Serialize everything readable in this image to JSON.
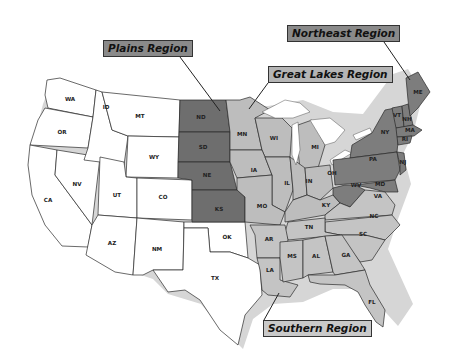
{
  "map": {
    "regions": [
      {
        "id": "plains",
        "label": "Plains Region",
        "color": "#6e6e6e",
        "states": [
          "ND",
          "SD",
          "NE",
          "KS"
        ]
      },
      {
        "id": "great_lakes",
        "label": "Great Lakes Region",
        "color": "#bdbdbd",
        "states": [
          "MN",
          "WI",
          "MI",
          "IA",
          "IL",
          "IN",
          "OH",
          "MO",
          "KY"
        ]
      },
      {
        "id": "northeast",
        "label": "Northeast Region",
        "color": "#7d7d7d",
        "states": [
          "ME",
          "VT",
          "NH",
          "MA",
          "RI",
          "CT",
          "NY",
          "NJ",
          "PA",
          "DE",
          "MD",
          "WV"
        ]
      },
      {
        "id": "southern",
        "label": "Southern Region",
        "color": "#c4c4c4",
        "states": [
          "VA",
          "NC",
          "SC",
          "TN",
          "AR",
          "LA",
          "MS",
          "AL",
          "GA",
          "FL"
        ]
      },
      {
        "id": "west",
        "label": "",
        "color": "#ffffff",
        "states": [
          "WA",
          "OR",
          "CA",
          "ID",
          "NV",
          "MT",
          "WY",
          "UT",
          "CO",
          "AZ",
          "NM",
          "OK",
          "TX"
        ]
      }
    ],
    "state_labels": {
      "WA": "WA",
      "OR": "OR",
      "CA": "CA",
      "ID": "ID",
      "NV": "NV",
      "MT": "MT",
      "WY": "WY",
      "UT": "UT",
      "CO": "CO",
      "AZ": "AZ",
      "NM": "NM",
      "OK": "OK",
      "TX": "TX",
      "ND": "ND",
      "SD": "SD",
      "NE": "NE",
      "KS": "KS",
      "MN": "MN",
      "WI": "WI",
      "MI": "MI",
      "IA": "IA",
      "IL": "IL",
      "IN": "IN",
      "OH": "OH",
      "MO": "MO",
      "KY": "KY",
      "ME": "ME",
      "VT": "VT",
      "NH": "NH",
      "MA": "MA",
      "RI": "RI",
      "NY": "NY",
      "PA": "PA",
      "NJ": "NJ",
      "MD": "MD",
      "WV": "WV",
      "VA": "VA",
      "NC": "NC",
      "SC": "SC",
      "TN": "TN",
      "AR": "AR",
      "LA": "LA",
      "MS": "MS",
      "AL": "AL",
      "GA": "GA",
      "FL": "FL"
    }
  }
}
